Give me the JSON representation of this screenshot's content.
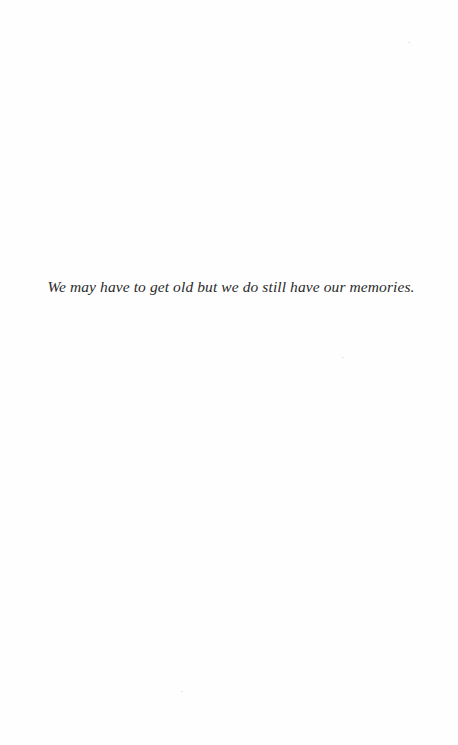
{
  "page": {
    "epigraph": "We may have to get old but we do still have our memories."
  }
}
